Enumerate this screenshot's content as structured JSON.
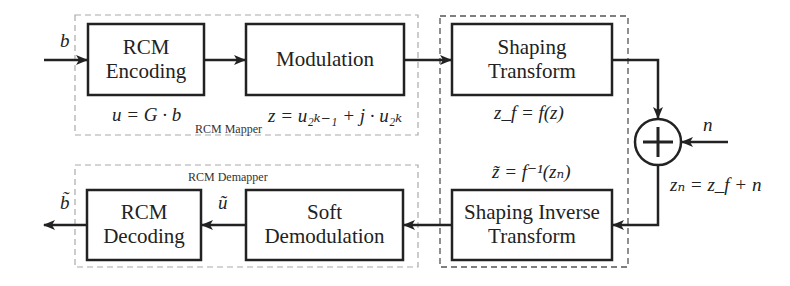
{
  "mapper": {
    "title": "RCM Mapper",
    "encoding": {
      "line1": "RCM",
      "line2": "Encoding",
      "eq": "u = G · b"
    },
    "modulation": {
      "label": "Modulation",
      "eq": "z = u₂ₖ₋₁ + j · u₂ₖ"
    }
  },
  "channel": {
    "shaping": {
      "line1": "Shaping",
      "line2": "Transform",
      "eq": "z_f = f(z)"
    },
    "inverse": {
      "line1": "Shaping Inverse",
      "line2": "Transform",
      "eq": "z̃ = f⁻¹(zₙ)"
    },
    "adder": {
      "symbol": "+",
      "noise": "n",
      "eq": "zₙ = z_f + n"
    }
  },
  "demapper": {
    "title": "RCM Demapper",
    "soft": {
      "line1": "Soft",
      "line2": "Demodulation",
      "out": "ũ"
    },
    "decoding": {
      "line1": "RCM",
      "line2": "Decoding",
      "out": "b̃"
    }
  },
  "input": {
    "label": "b"
  }
}
